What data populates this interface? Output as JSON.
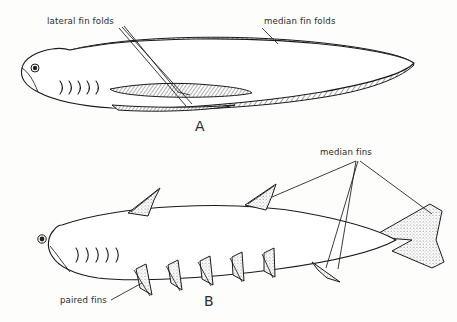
{
  "figure": {
    "background_color": "#fdfdfc",
    "ink_color": "#1a1a1a",
    "type": "scientific-line-illustration",
    "panels": [
      {
        "id": "A",
        "letter": "A",
        "letter_position": {
          "x": 195,
          "y": 131
        },
        "description": "hypothetical ancestral fish with continuous lateral and median fin folds",
        "labels": [
          {
            "name": "lateral-fin-folds",
            "text": "lateral fin folds",
            "x": 47,
            "y": 24,
            "anchor": "start"
          },
          {
            "name": "median-fin-folds",
            "text": "median fin folds",
            "x": 264,
            "y": 24,
            "anchor": "start"
          }
        ],
        "gill_slit_count": 5
      },
      {
        "id": "B",
        "letter": "B",
        "letter_position": {
          "x": 204,
          "y": 306
        },
        "description": "derived fish with discrete median fins and paired fins",
        "labels": [
          {
            "name": "median-fins",
            "text": "median fins",
            "x": 320,
            "y": 155,
            "anchor": "start"
          },
          {
            "name": "paired-fins",
            "text": "paired fins",
            "x": 60,
            "y": 303,
            "anchor": "start"
          }
        ],
        "gill_slit_count": 5,
        "dorsal_fin_count": 2,
        "anal_fin_count": 1,
        "paired_fin_count": 5,
        "caudal_fin": "forked, stippled"
      }
    ]
  }
}
